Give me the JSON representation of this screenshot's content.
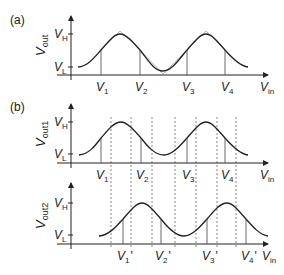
{
  "panels": {
    "a": {
      "label": "(a)",
      "y_axis": {
        "symbol": "V",
        "sub": "out"
      },
      "y_ticks": [
        {
          "symbol": "V",
          "sub": "H"
        },
        {
          "symbol": "V",
          "sub": "L"
        }
      ],
      "x_axis": {
        "symbol": "V",
        "sub": "in"
      },
      "x_marks": [
        {
          "symbol": "V",
          "sub": "1"
        },
        {
          "symbol": "V",
          "sub": "2"
        },
        {
          "symbol": "V",
          "sub": "3"
        },
        {
          "symbol": "V",
          "sub": "4"
        }
      ]
    },
    "b": {
      "label": "(b)",
      "top": {
        "y_axis": {
          "symbol": "V",
          "sub": "out1"
        },
        "y_ticks": [
          {
            "symbol": "V",
            "sub": "H"
          },
          {
            "symbol": "V",
            "sub": "L"
          }
        ],
        "x_axis": {
          "symbol": "V",
          "sub": "in"
        },
        "x_marks": [
          {
            "symbol": "V",
            "sub": "1"
          },
          {
            "symbol": "V",
            "sub": "2"
          },
          {
            "symbol": "V",
            "sub": "3"
          },
          {
            "symbol": "V",
            "sub": "4"
          }
        ]
      },
      "bottom": {
        "y_axis": {
          "symbol": "V",
          "sub": "out2"
        },
        "y_ticks": [
          {
            "symbol": "V",
            "sub": "H"
          },
          {
            "symbol": "V",
            "sub": "L"
          }
        ],
        "x_axis": {
          "symbol": "V",
          "sub": "in"
        },
        "x_marks": [
          {
            "symbol": "V",
            "sub": "1",
            "prime": "'"
          },
          {
            "symbol": "V",
            "sub": "2",
            "prime": "'"
          },
          {
            "symbol": "V",
            "sub": "3",
            "prime": "'"
          },
          {
            "symbol": "V",
            "sub": "4",
            "prime": "'"
          }
        ]
      }
    }
  },
  "colors": {
    "line": "#222222",
    "ideal_curve": "#aaaaaa",
    "dashed": "#555555"
  }
}
